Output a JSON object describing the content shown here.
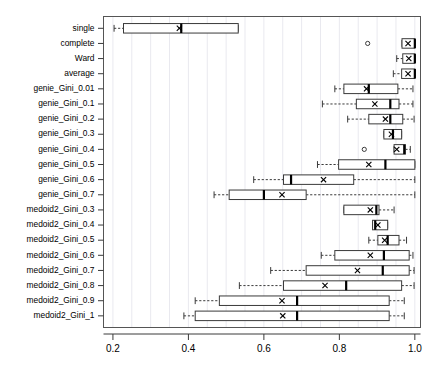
{
  "chart_data": {
    "type": "boxplot",
    "title": "",
    "xlabel": "",
    "ylabel": "",
    "xlim": [
      0.175,
      1.015
    ],
    "xticks": [
      0.2,
      0.4,
      0.6,
      0.8,
      1.0
    ],
    "xticklabels": [
      "0.2",
      "0.4",
      "0.6",
      "0.8",
      "1.0"
    ],
    "grid": true,
    "orientation": "horizontal",
    "mean_marker": "x",
    "categories": [
      "single",
      "complete",
      "Ward",
      "average",
      "genie_Gini_0.01",
      "genie_Gini_0.1",
      "genie_Gini_0.2",
      "genie_Gini_0.3",
      "genie_Gini_0.4",
      "genie_Gini_0.5",
      "genie_Gini_0.6",
      "genie_Gini_0.7",
      "medoid2_Gini_0.3",
      "medoid2_Gini_0.4",
      "medoid2_Gini_0.5",
      "medoid2_Gini_0.6",
      "medoid2_Gini_0.7",
      "medoid2_Gini_0.8",
      "medoid2_Gini_0.9",
      "medoid2_Gini_1"
    ],
    "boxes": [
      {
        "label": "single",
        "whisker_low": 0.203,
        "q1": 0.228,
        "median": 0.381,
        "q3": 0.532,
        "whisker_high": 0.532,
        "mean": 0.376,
        "outliers": []
      },
      {
        "label": "complete",
        "whisker_low": 0.966,
        "q1": 0.966,
        "median": 1.0,
        "q3": 1.0,
        "whisker_high": 1.0,
        "mean": 0.982,
        "outliers": [
          0.875
        ]
      },
      {
        "label": "Ward",
        "whisker_low": 0.952,
        "q1": 0.968,
        "median": 1.0,
        "q3": 1.0,
        "whisker_high": 1.0,
        "mean": 0.984,
        "outliers": []
      },
      {
        "label": "average",
        "whisker_low": 0.943,
        "q1": 0.965,
        "median": 1.0,
        "q3": 1.0,
        "whisker_high": 1.0,
        "mean": 0.982,
        "outliers": []
      },
      {
        "label": "genie_Gini_0.01",
        "whisker_low": 0.788,
        "q1": 0.812,
        "median": 0.878,
        "q3": 0.955,
        "whisker_high": 0.995,
        "mean": 0.872,
        "outliers": []
      },
      {
        "label": "genie_Gini_0.1",
        "whisker_low": 0.755,
        "q1": 0.845,
        "median": 0.935,
        "q3": 0.958,
        "whisker_high": 0.995,
        "mean": 0.894,
        "outliers": []
      },
      {
        "label": "genie_Gini_0.2",
        "whisker_low": 0.822,
        "q1": 0.878,
        "median": 0.935,
        "q3": 0.968,
        "whisker_high": 0.998,
        "mean": 0.922,
        "outliers": []
      },
      {
        "label": "genie_Gini_0.3",
        "whisker_low": 0.918,
        "q1": 0.918,
        "median": 0.942,
        "q3": 0.965,
        "whisker_high": 0.965,
        "mean": 0.938,
        "outliers": []
      },
      {
        "label": "genie_Gini_0.4",
        "whisker_low": 0.945,
        "q1": 0.945,
        "median": 0.972,
        "q3": 0.975,
        "whisker_high": 0.988,
        "mean": 0.952,
        "outliers": [
          0.866
        ]
      },
      {
        "label": "genie_Gini_0.5",
        "whisker_low": 0.742,
        "q1": 0.798,
        "median": 0.922,
        "q3": 1.0,
        "whisker_high": 1.0,
        "mean": 0.878,
        "outliers": []
      },
      {
        "label": "genie_Gini_0.6",
        "whisker_low": 0.573,
        "q1": 0.652,
        "median": 0.672,
        "q3": 0.838,
        "whisker_high": 1.0,
        "mean": 0.758,
        "outliers": []
      },
      {
        "label": "genie_Gini_0.7",
        "whisker_low": 0.468,
        "q1": 0.508,
        "median": 0.6,
        "q3": 0.712,
        "whisker_high": 1.0,
        "mean": 0.648,
        "outliers": []
      },
      {
        "label": "medoid2_Gini_0.3",
        "whisker_low": 0.812,
        "q1": 0.812,
        "median": 0.898,
        "q3": 0.905,
        "whisker_high": 0.945,
        "mean": 0.882,
        "outliers": []
      },
      {
        "label": "medoid2_Gini_0.4",
        "whisker_low": 0.888,
        "q1": 0.888,
        "median": 0.895,
        "q3": 0.928,
        "whisker_high": 0.928,
        "mean": 0.902,
        "outliers": []
      },
      {
        "label": "medoid2_Gini_0.5",
        "whisker_low": 0.878,
        "q1": 0.902,
        "median": 0.928,
        "q3": 0.958,
        "whisker_high": 0.978,
        "mean": 0.92,
        "outliers": []
      },
      {
        "label": "medoid2_Gini_0.6",
        "whisker_low": 0.752,
        "q1": 0.788,
        "median": 0.918,
        "q3": 0.985,
        "whisker_high": 0.995,
        "mean": 0.882,
        "outliers": []
      },
      {
        "label": "medoid2_Gini_0.7",
        "whisker_low": 0.618,
        "q1": 0.712,
        "median": 0.915,
        "q3": 0.985,
        "whisker_high": 0.998,
        "mean": 0.848,
        "outliers": []
      },
      {
        "label": "medoid2_Gini_0.8",
        "whisker_low": 0.535,
        "q1": 0.652,
        "median": 0.818,
        "q3": 0.965,
        "whisker_high": 0.998,
        "mean": 0.762,
        "outliers": []
      },
      {
        "label": "medoid2_Gini_0.9",
        "whisker_low": 0.418,
        "q1": 0.482,
        "median": 0.688,
        "q3": 0.932,
        "whisker_high": 0.972,
        "mean": 0.648,
        "outliers": []
      },
      {
        "label": "medoid2_Gini_1",
        "whisker_low": 0.388,
        "q1": 0.418,
        "median": 0.688,
        "q3": 0.932,
        "whisker_high": 0.972,
        "mean": 0.65,
        "outliers": []
      }
    ]
  },
  "colors": {
    "box_stroke": "#3a3a3a",
    "median": "#000000",
    "grid": "#e9e9ef",
    "frame": "#555555",
    "background": "#ffffff",
    "text": "#000000"
  }
}
